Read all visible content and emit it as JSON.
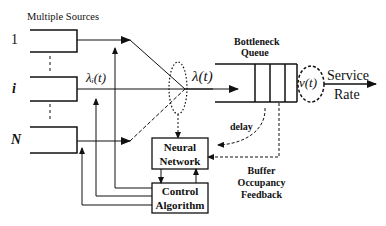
{
  "diagram": {
    "title_sources": "Multiple Sources",
    "source_labels": [
      "1",
      "i",
      "N"
    ],
    "lambda_i": "λᵢ(t)",
    "lambda": "λ(t)",
    "queue_label_line1": "Bottleneck",
    "queue_label_line2": "Queue",
    "service_symbol": "v(t)",
    "service_line1": "Service",
    "service_line2": "Rate",
    "delay": "delay",
    "neural_line1": "Neural",
    "neural_line2": "Network",
    "control_line1": "Control",
    "control_line2": "Algorithm",
    "feedback_line1": "Buffer",
    "feedback_line2": "Occupancy",
    "feedback_line3": "Feedback"
  }
}
